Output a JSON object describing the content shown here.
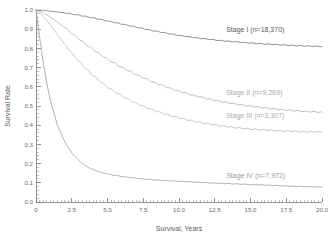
{
  "chart_data": {
    "type": "line",
    "title": "",
    "xlabel": "Survival, Years",
    "ylabel": "Survival Rate",
    "xlim": [
      0,
      20
    ],
    "ylim": [
      0,
      1
    ],
    "grid": false,
    "legend_position": "inline-right",
    "x_ticks": [
      "0",
      "2.5",
      "5.0",
      "7.5",
      "10.0",
      "12.5",
      "15.0",
      "17.5",
      "20.0"
    ],
    "x_tick_values": [
      0,
      2.5,
      5,
      7.5,
      10,
      12.5,
      15,
      17.5,
      20
    ],
    "x_minor_step": 0.25,
    "y_ticks": [
      "0.0",
      "0.1",
      "0.2",
      "0.3",
      "0.4",
      "0.5",
      "0.6",
      "0.7",
      "0.8",
      "0.9",
      "1.0"
    ],
    "y_tick_values": [
      0.0,
      0.1,
      0.2,
      0.3,
      0.4,
      0.5,
      0.6,
      0.7,
      0.8,
      0.9,
      1.0
    ],
    "x": [
      0,
      0.25,
      0.5,
      0.75,
      1,
      1.5,
      2,
      2.5,
      3,
      3.5,
      4,
      4.5,
      5,
      5.5,
      6,
      6.5,
      7,
      7.5,
      8,
      8.5,
      9,
      9.5,
      10,
      11,
      12,
      13,
      14,
      15,
      16,
      17,
      18,
      19,
      20
    ],
    "series": [
      {
        "name": "Stage I",
        "n": "18,370",
        "label": "Stage I (n=18,370)",
        "color": "#7d7d7d",
        "label_color": "#5a5a5a",
        "label_x": 13.3,
        "label_y": 0.885,
        "values": [
          1.0,
          0.999,
          0.998,
          0.996,
          0.994,
          0.99,
          0.985,
          0.979,
          0.973,
          0.966,
          0.959,
          0.951,
          0.943,
          0.935,
          0.927,
          0.919,
          0.911,
          0.903,
          0.895,
          0.888,
          0.881,
          0.874,
          0.868,
          0.857,
          0.848,
          0.84,
          0.834,
          0.828,
          0.823,
          0.819,
          0.815,
          0.812,
          0.81
        ]
      },
      {
        "name": "Stage II",
        "n": "9,269",
        "label": "Stage II (n=9,269)",
        "color": "#b4b4b4",
        "label_color": "#a8a8a8",
        "label_x": 13.3,
        "label_y": 0.555,
        "values": [
          1.0,
          0.993,
          0.985,
          0.975,
          0.963,
          0.937,
          0.909,
          0.879,
          0.849,
          0.82,
          0.793,
          0.768,
          0.744,
          0.722,
          0.701,
          0.682,
          0.664,
          0.647,
          0.631,
          0.616,
          0.602,
          0.589,
          0.577,
          0.556,
          0.538,
          0.523,
          0.51,
          0.499,
          0.49,
          0.482,
          0.476,
          0.471,
          0.468
        ]
      },
      {
        "name": "Stage III",
        "n": "3,307",
        "label": "Stage III (n=3,307)",
        "color": "#bcbcbc",
        "label_color": "#adadad",
        "label_x": 13.3,
        "label_y": 0.435,
        "values": [
          1.0,
          0.985,
          0.967,
          0.946,
          0.922,
          0.872,
          0.822,
          0.776,
          0.733,
          0.694,
          0.659,
          0.628,
          0.6,
          0.575,
          0.553,
          0.533,
          0.515,
          0.499,
          0.484,
          0.471,
          0.459,
          0.448,
          0.438,
          0.421,
          0.407,
          0.396,
          0.387,
          0.38,
          0.375,
          0.371,
          0.368,
          0.366,
          0.365
        ]
      },
      {
        "name": "Stage IV",
        "n": "7,972",
        "label": "Stage IV (n=7,972)",
        "color": "#a5a5a5",
        "label_color": "#9d9d9d",
        "label_x": 13.3,
        "label_y": 0.125,
        "values": [
          1.0,
          0.86,
          0.73,
          0.62,
          0.53,
          0.4,
          0.315,
          0.256,
          0.215,
          0.187,
          0.168,
          0.155,
          0.146,
          0.139,
          0.133,
          0.128,
          0.124,
          0.12,
          0.117,
          0.114,
          0.112,
          0.11,
          0.108,
          0.104,
          0.1,
          0.097,
          0.094,
          0.091,
          0.088,
          0.085,
          0.082,
          0.08,
          0.078
        ]
      }
    ]
  },
  "axes": {
    "x_title": "Survival, Years",
    "y_title": "Survival Rate"
  }
}
